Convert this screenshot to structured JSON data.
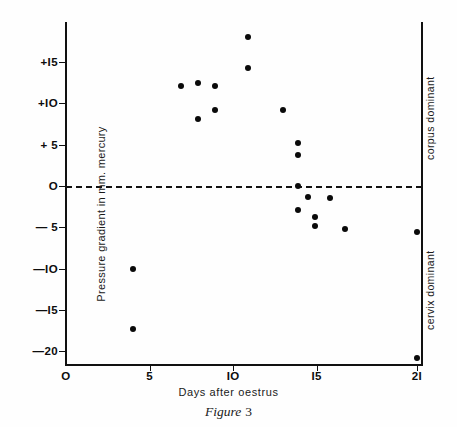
{
  "caption": {
    "word": "Figure",
    "number": "3"
  },
  "annotations": {
    "corpus": "corpus dominant",
    "cervix": "cervix dominant"
  },
  "chart_data": {
    "type": "scatter",
    "title": "",
    "xlabel": "Days after oestrus",
    "ylabel": "Pressure gradient in mm. mercury",
    "xlim": [
      0,
      21.4
    ],
    "ylim": [
      -21.5,
      19.5
    ],
    "xticks": [
      0,
      5,
      10,
      15,
      21
    ],
    "xticklabels": [
      "O",
      "5",
      "IO",
      "I5",
      "2I"
    ],
    "yticks": [
      15,
      10,
      5,
      0,
      -5,
      -10,
      -15,
      -20
    ],
    "yticklabels": [
      "+I5",
      "+IO",
      "+ 5",
      "O",
      "— 5",
      "—IO",
      "—I5",
      "—20"
    ],
    "grid": false,
    "legend": false,
    "reference_lines": [
      {
        "axis": "y",
        "value": 0,
        "style": "dashed",
        "label": ""
      }
    ],
    "marker": "filled-circle",
    "marker_color": "#0a0a0a",
    "points": [
      {
        "x": 4.0,
        "y": -10.0
      },
      {
        "x": 4.0,
        "y": -17.3
      },
      {
        "x": 6.9,
        "y": 12.1
      },
      {
        "x": 7.9,
        "y": 12.4
      },
      {
        "x": 7.9,
        "y": 8.1
      },
      {
        "x": 8.9,
        "y": 12.1
      },
      {
        "x": 8.9,
        "y": 9.2
      },
      {
        "x": 10.9,
        "y": 18.0
      },
      {
        "x": 10.9,
        "y": 14.3
      },
      {
        "x": 13.0,
        "y": 9.2
      },
      {
        "x": 13.9,
        "y": 5.2
      },
      {
        "x": 13.9,
        "y": 3.8
      },
      {
        "x": 13.9,
        "y": 0.0
      },
      {
        "x": 13.9,
        "y": -2.9
      },
      {
        "x": 14.5,
        "y": -1.3
      },
      {
        "x": 14.9,
        "y": -3.8
      },
      {
        "x": 14.9,
        "y": -4.8
      },
      {
        "x": 15.8,
        "y": -1.4
      },
      {
        "x": 16.7,
        "y": -5.2
      },
      {
        "x": 21.0,
        "y": -5.6
      },
      {
        "x": 21.0,
        "y": -20.8
      }
    ]
  }
}
